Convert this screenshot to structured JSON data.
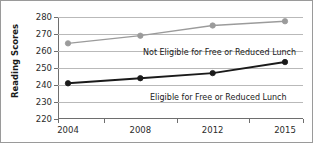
{
  "chart_data": {
    "type": "line",
    "title": "",
    "xlabel": "",
    "ylabel": "Reading Scores",
    "categories": [
      "2004",
      "2008",
      "2012",
      "2015"
    ],
    "ylim": [
      220,
      280
    ],
    "yticks": [
      280,
      270,
      260,
      250,
      240,
      230,
      220
    ],
    "grid": true,
    "legend_position": "inline-annotation",
    "series": [
      {
        "name": "Not Eligible for Free or Reduced Lunch",
        "color": "#9b9b9b",
        "values": [
          264.5,
          269,
          275,
          277.5
        ]
      },
      {
        "name": "Eligible for Free or Reduced Lunch",
        "color": "#1a1a1a",
        "values": [
          241,
          244,
          247,
          253.5
        ]
      }
    ]
  },
  "axis": {
    "y_title": "Reading Scores",
    "y_tick_labels": [
      "280",
      "270",
      "260",
      "250",
      "240",
      "230",
      "220"
    ],
    "x_tick_labels": [
      "2004",
      "2008",
      "2012",
      "2015"
    ]
  },
  "annotations": {
    "upper_series_label": "Not Eligible for Free or Reduced Lunch",
    "lower_series_label": "Eligible for Free or Reduced Lunch"
  },
  "colors": {
    "upper_series": "#9b9b9b",
    "lower_series": "#1a1a1a",
    "gridline": "#b9b9b9",
    "axis": "#6e6e6e",
    "frame": "#9a9a9a",
    "background": "#ffffff"
  }
}
